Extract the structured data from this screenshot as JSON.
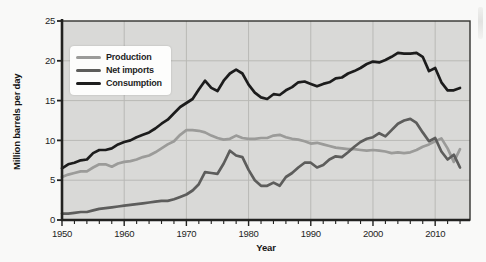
{
  "chart_data": {
    "type": "line",
    "title": "",
    "xlabel": "Year",
    "ylabel": "Million barrels per day",
    "x_range": [
      1950,
      2015.6
    ],
    "ylim": [
      0,
      25
    ],
    "y_ticks": [
      0,
      5,
      10,
      15,
      20,
      25
    ],
    "x_ticks": [
      1950,
      1960,
      1970,
      1980,
      1990,
      2000,
      2010
    ],
    "x_minor_tick_step": 2,
    "grid": true,
    "legend_position": "upper-left-inside",
    "colors": {
      "page_background": "#f9f9f8",
      "plot_background": "#d9d9d7",
      "gridline": "#b9b9b6",
      "frame": "#333330",
      "axis": "#222220",
      "text": "#1e1e1e"
    },
    "x": [
      1950,
      1951,
      1952,
      1953,
      1954,
      1955,
      1956,
      1957,
      1958,
      1959,
      1960,
      1961,
      1962,
      1963,
      1964,
      1965,
      1966,
      1967,
      1968,
      1969,
      1970,
      1971,
      1972,
      1973,
      1974,
      1975,
      1976,
      1977,
      1978,
      1979,
      1980,
      1981,
      1982,
      1983,
      1984,
      1985,
      1986,
      1987,
      1988,
      1989,
      1990,
      1991,
      1992,
      1993,
      1994,
      1995,
      1996,
      1997,
      1998,
      1999,
      2000,
      2001,
      2002,
      2003,
      2004,
      2005,
      2006,
      2007,
      2008,
      2009,
      2010,
      2011,
      2012,
      2013,
      2014
    ],
    "series": [
      {
        "name": "Production",
        "color": "#9b9b99",
        "values": [
          5.4,
          5.7,
          5.9,
          6.1,
          6.1,
          6.6,
          7.0,
          7.0,
          6.7,
          7.1,
          7.3,
          7.4,
          7.6,
          7.9,
          8.1,
          8.5,
          9.0,
          9.5,
          9.9,
          10.7,
          11.3,
          11.3,
          11.2,
          11.0,
          10.6,
          10.3,
          10.1,
          10.2,
          10.6,
          10.3,
          10.2,
          10.2,
          10.3,
          10.3,
          10.6,
          10.7,
          10.4,
          10.2,
          10.1,
          9.9,
          9.6,
          9.7,
          9.5,
          9.3,
          9.1,
          9.0,
          8.9,
          8.9,
          8.8,
          8.7,
          8.8,
          8.7,
          8.6,
          8.4,
          8.5,
          8.4,
          8.5,
          8.8,
          9.2,
          9.5,
          9.9,
          10.25,
          9.0,
          7.3,
          8.9
        ]
      },
      {
        "name": "Net imports",
        "color": "#5d5d5b",
        "values": [
          0.8,
          0.8,
          0.9,
          1.0,
          1.0,
          1.2,
          1.4,
          1.5,
          1.6,
          1.7,
          1.8,
          1.9,
          2.0,
          2.1,
          2.2,
          2.3,
          2.4,
          2.4,
          2.6,
          2.9,
          3.2,
          3.7,
          4.5,
          6.0,
          5.9,
          5.8,
          7.1,
          8.7,
          8.1,
          7.9,
          6.3,
          5.0,
          4.3,
          4.3,
          4.7,
          4.3,
          5.4,
          5.9,
          6.6,
          7.2,
          7.2,
          6.6,
          6.9,
          7.6,
          8.0,
          7.9,
          8.5,
          9.2,
          9.8,
          10.2,
          10.4,
          10.9,
          10.5,
          11.3,
          12.1,
          12.5,
          12.7,
          12.2,
          11.0,
          9.9,
          10.3,
          8.6,
          7.6,
          8.2,
          6.6
        ]
      },
      {
        "name": "Consumption",
        "color": "#1d1d1d",
        "values": [
          6.5,
          7.0,
          7.2,
          7.5,
          7.6,
          8.4,
          8.8,
          8.8,
          9.0,
          9.5,
          9.8,
          10.0,
          10.4,
          10.7,
          11.0,
          11.5,
          12.1,
          12.6,
          13.4,
          14.2,
          14.7,
          15.2,
          16.4,
          17.5,
          16.6,
          16.2,
          17.5,
          18.4,
          18.9,
          18.4,
          17.0,
          16.0,
          15.4,
          15.2,
          15.8,
          15.7,
          16.3,
          16.7,
          17.3,
          17.4,
          17.1,
          16.8,
          17.1,
          17.3,
          17.8,
          17.9,
          18.4,
          18.7,
          19.1,
          19.6,
          19.9,
          19.8,
          20.1,
          20.5,
          21.0,
          20.9,
          20.9,
          21.0,
          20.5,
          18.7,
          19.1,
          17.3,
          16.3,
          16.3,
          16.6
        ]
      }
    ]
  }
}
